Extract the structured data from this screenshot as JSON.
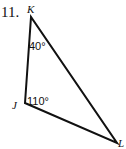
{
  "problem": {
    "number": "11."
  },
  "vertices": [
    {
      "label": "K",
      "x": 31,
      "y": 17
    },
    {
      "label": "J",
      "x": 25,
      "y": 103
    },
    {
      "label": "L",
      "x": 117,
      "y": 143
    }
  ],
  "angles": [
    {
      "vertex": "K",
      "value": "40°"
    },
    {
      "vertex": "J",
      "value": "110°"
    }
  ],
  "colors": {
    "stroke": "#111111"
  }
}
